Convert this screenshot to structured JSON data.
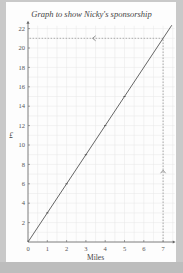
{
  "chart_data": {
    "type": "line",
    "title": "Graph to show Nicky's sponsorship",
    "xlabel": "Miles",
    "ylabel": "£",
    "xlim": [
      0,
      7
    ],
    "ylim": [
      0,
      22
    ],
    "x_ticks": [
      0,
      1,
      2,
      3,
      4,
      5,
      6,
      7
    ],
    "y_ticks": [
      2,
      4,
      6,
      8,
      10,
      12,
      14,
      16,
      18,
      20,
      22
    ],
    "grid": true,
    "series": [
      {
        "name": "Sponsorship",
        "x": [
          0,
          1,
          2,
          3,
          4,
          5,
          6,
          7
        ],
        "values": [
          0,
          3,
          6,
          9,
          12,
          15,
          18,
          21
        ],
        "marked_points": [
          [
            1,
            3
          ],
          [
            2,
            6
          ],
          [
            3,
            9
          ],
          [
            4,
            12
          ],
          [
            5,
            15
          ]
        ]
      }
    ],
    "annotations": [
      {
        "type": "dashed-vertical",
        "x": 7,
        "from_y": 0,
        "to_y": 21,
        "arrow": "up"
      },
      {
        "type": "dashed-horizontal",
        "y": 21,
        "from_x": 7,
        "to_x": 0,
        "arrow": "left"
      }
    ]
  },
  "colors": {
    "background": "#c9c9c9",
    "panel": "#fdfdfd",
    "grid": "#e6e6e6",
    "line": "#555555",
    "axis": "#666666"
  }
}
